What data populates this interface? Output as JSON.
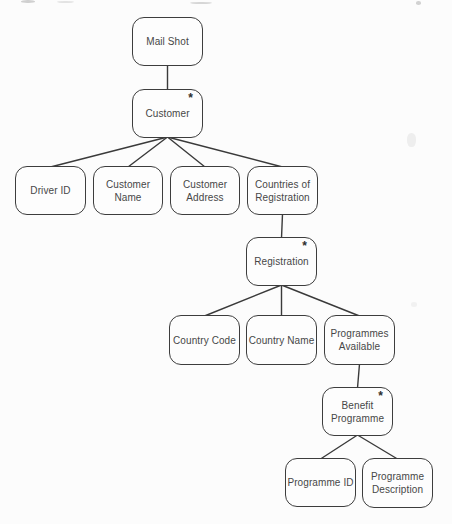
{
  "page": {
    "background": "#fcfcfc",
    "ink_color": "#3d3d3d",
    "text_color": "#474747"
  },
  "diagram": {
    "type": "structure-tree",
    "multiplicity_symbol": "*",
    "nodes": [
      {
        "id": "mail-shot",
        "label": "Mail Shot",
        "starred": false,
        "x": 132,
        "y": 17,
        "w": 71,
        "h": 49
      },
      {
        "id": "customer",
        "label": "Customer",
        "starred": true,
        "x": 132,
        "y": 89,
        "w": 71,
        "h": 49
      },
      {
        "id": "driver-id",
        "label": "Driver ID",
        "starred": false,
        "x": 15,
        "y": 166,
        "w": 71,
        "h": 49
      },
      {
        "id": "customer-name",
        "label": "Customer Name",
        "starred": false,
        "x": 93,
        "y": 166,
        "w": 70,
        "h": 49
      },
      {
        "id": "customer-address",
        "label": "Customer\nAddress",
        "starred": false,
        "x": 170,
        "y": 166,
        "w": 70,
        "h": 49
      },
      {
        "id": "countries-of-registration",
        "label": "Countries of\nRegistration",
        "starred": false,
        "x": 247,
        "y": 166,
        "w": 71,
        "h": 49
      },
      {
        "id": "registration",
        "label": "Registration",
        "starred": true,
        "x": 246,
        "y": 237,
        "w": 71,
        "h": 49
      },
      {
        "id": "country-code",
        "label": "Country Code",
        "starred": false,
        "x": 169,
        "y": 315,
        "w": 71,
        "h": 50
      },
      {
        "id": "country-name",
        "label": "Country Name",
        "starred": false,
        "x": 246,
        "y": 315,
        "w": 71,
        "h": 50
      },
      {
        "id": "programmes-available",
        "label": "Programmes\nAvailable",
        "starred": false,
        "x": 324,
        "y": 315,
        "w": 71,
        "h": 50
      },
      {
        "id": "benefit-programme",
        "label": "Benefit\nProgramme",
        "starred": true,
        "x": 322,
        "y": 387,
        "w": 71,
        "h": 49
      },
      {
        "id": "programme-id",
        "label": "Programme ID",
        "starred": false,
        "x": 285,
        "y": 458,
        "w": 71,
        "h": 49
      },
      {
        "id": "programme-description",
        "label": "Programme\nDescription",
        "starred": false,
        "x": 362,
        "y": 458,
        "w": 71,
        "h": 50
      }
    ],
    "edges": [
      {
        "from": "mail-shot",
        "to": "customer"
      },
      {
        "from": "customer",
        "to": "driver-id"
      },
      {
        "from": "customer",
        "to": "customer-name"
      },
      {
        "from": "customer",
        "to": "customer-address"
      },
      {
        "from": "customer",
        "to": "countries-of-registration"
      },
      {
        "from": "countries-of-registration",
        "to": "registration"
      },
      {
        "from": "registration",
        "to": "country-code"
      },
      {
        "from": "registration",
        "to": "country-name"
      },
      {
        "from": "registration",
        "to": "programmes-available"
      },
      {
        "from": "programmes-available",
        "to": "benefit-programme"
      },
      {
        "from": "benefit-programme",
        "to": "programme-id"
      },
      {
        "from": "benefit-programme",
        "to": "programme-description"
      }
    ]
  }
}
